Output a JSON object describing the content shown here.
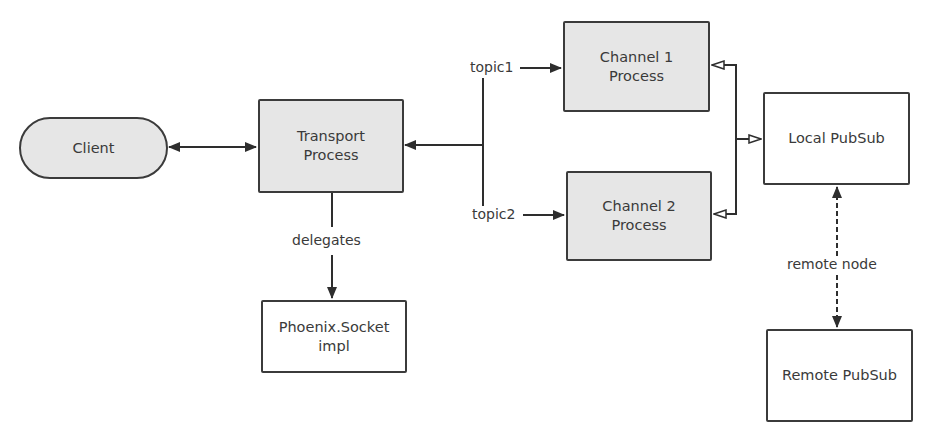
{
  "diagram": {
    "nodes": {
      "client": {
        "label": "Client"
      },
      "transport": {
        "label": "Transport\nProcess"
      },
      "channel1": {
        "label": "Channel 1\nProcess"
      },
      "channel2": {
        "label": "Channel 2\nProcess"
      },
      "local_pubsub": {
        "label": "Local PubSub"
      },
      "remote_pubsub": {
        "label": "Remote PubSub"
      },
      "phoenix_socket": {
        "label": "Phoenix.Socket\nimpl"
      }
    },
    "edge_labels": {
      "topic1": "topic1",
      "topic2": "topic2",
      "delegates": "delegates",
      "remote_node": "remote node"
    },
    "colors": {
      "process_fill": "#e6e6e6",
      "plain_fill": "#ffffff",
      "stroke": "#3b3b3b"
    }
  }
}
